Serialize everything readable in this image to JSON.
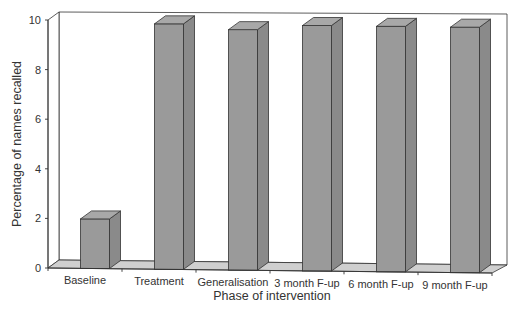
{
  "chart_data": {
    "type": "bar",
    "style": "3d",
    "title": "",
    "xlabel": "Phase of intervention",
    "ylabel": "Percentage of names recalled",
    "categories": [
      "Baseline",
      "Treatment",
      "Generalisation",
      "3 month F-up",
      "6 month F-up",
      "9 month F-up"
    ],
    "values": [
      2.0,
      9.9,
      9.7,
      9.9,
      9.9,
      9.9
    ],
    "ylim": [
      0,
      10
    ],
    "yticks": [
      0,
      2,
      4,
      6,
      8,
      10
    ],
    "grid": false,
    "legend": "none",
    "colors": {
      "bar_front": "#9a9a9a",
      "bar_side": "#8a8a8a",
      "bar_top": "#a8a8a8",
      "floor": "#cfcfcf",
      "wall": "#ffffff",
      "line": "#333333"
    }
  }
}
